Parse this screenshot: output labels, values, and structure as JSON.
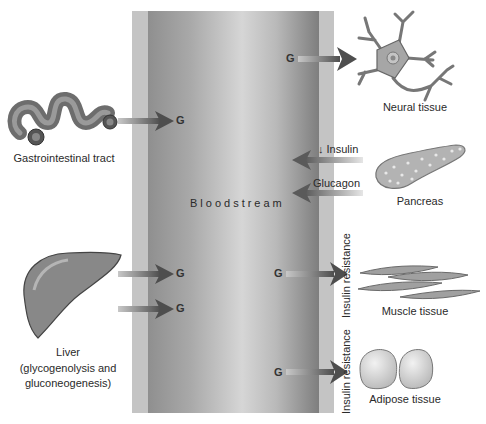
{
  "diagram": {
    "center": {
      "label": "Bloodstream"
    },
    "glucose_symbol": "G",
    "sources": [
      {
        "id": "gi",
        "label": "Gastrointestinal tract"
      },
      {
        "id": "liver",
        "label": "Liver",
        "sublabel_1": "(glycogenolysis and",
        "sublabel_2": "gluconeogenesis)"
      }
    ],
    "hormones": {
      "insulin": "↓ Insulin",
      "glucagon": "Glucagon",
      "source": "Pancreas"
    },
    "targets": [
      {
        "id": "neural",
        "label": "Neural tissue"
      },
      {
        "id": "muscle",
        "label": "Muscle tissue",
        "annotation": "Insulin resistance"
      },
      {
        "id": "adipose",
        "label": "Adipose tissue",
        "annotation": "Insulin resistance"
      }
    ],
    "colors": {
      "arrow": "#555555",
      "organ": "#8a8a8a",
      "bloodstream_outer": "#c4c4c4",
      "bloodstream_dark": "#7e7e7e"
    }
  }
}
